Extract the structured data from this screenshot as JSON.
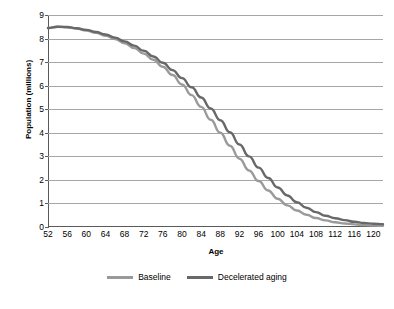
{
  "chart_data": {
    "type": "line",
    "title": "",
    "xlabel": "Age",
    "ylabel": "Population (millions)",
    "xlim": [
      52,
      122
    ],
    "ylim": [
      0,
      9
    ],
    "grid": true,
    "legend_position": "bottom",
    "xticks": [
      52,
      56,
      60,
      64,
      68,
      72,
      76,
      80,
      84,
      88,
      92,
      96,
      100,
      104,
      108,
      112,
      116,
      120
    ],
    "yticks": [
      0,
      1,
      2,
      3,
      4,
      5,
      6,
      7,
      8,
      9
    ],
    "x": [
      52,
      54,
      56,
      58,
      60,
      62,
      64,
      66,
      68,
      70,
      72,
      74,
      76,
      78,
      80,
      82,
      84,
      86,
      88,
      90,
      92,
      94,
      96,
      98,
      100,
      102,
      104,
      106,
      108,
      110,
      112,
      114,
      116,
      118,
      120,
      122
    ],
    "series": [
      {
        "name": "Baseline",
        "color": "#9a9a9a",
        "values": [
          8.45,
          8.5,
          8.48,
          8.42,
          8.34,
          8.24,
          8.12,
          7.98,
          7.8,
          7.6,
          7.36,
          7.1,
          6.8,
          6.45,
          6.05,
          5.6,
          5.1,
          4.55,
          4.0,
          3.45,
          2.9,
          2.4,
          1.95,
          1.55,
          1.2,
          0.92,
          0.7,
          0.52,
          0.38,
          0.28,
          0.2,
          0.15,
          0.11,
          0.08,
          0.06,
          0.05
        ]
      },
      {
        "name": "Decelerated aging",
        "color": "#686868",
        "values": [
          8.45,
          8.5,
          8.49,
          8.44,
          8.37,
          8.28,
          8.17,
          8.04,
          7.88,
          7.7,
          7.48,
          7.24,
          6.97,
          6.66,
          6.32,
          5.93,
          5.5,
          5.03,
          4.53,
          4.02,
          3.5,
          3.0,
          2.52,
          2.08,
          1.68,
          1.34,
          1.05,
          0.82,
          0.63,
          0.48,
          0.37,
          0.29,
          0.22,
          0.17,
          0.14,
          0.12
        ]
      }
    ]
  },
  "legend": {
    "items": [
      {
        "label": "Baseline",
        "color": "#9a9a9a"
      },
      {
        "label": "Decelerated aging",
        "color": "#686868"
      }
    ]
  },
  "axes": {
    "x_title": "Age",
    "y_title": "Population (millions)"
  }
}
